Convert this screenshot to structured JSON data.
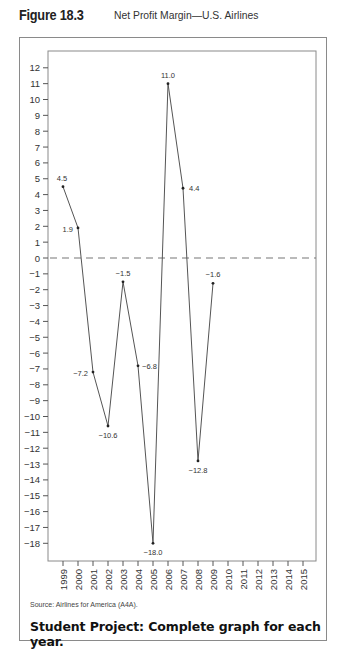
{
  "figure": {
    "number": "Figure 18.3",
    "caption": "Net Profit Margin—U.S. Airlines"
  },
  "source": "Source: Airlines for America (A4A).",
  "student_project": "Student Project: Complete graph for each year.",
  "chart_data": {
    "type": "line",
    "title": "Net Profit Margin—U.S. Airlines",
    "xlabel": "",
    "ylabel": "",
    "x": [
      1999,
      2000,
      2001,
      2002,
      2003,
      2004,
      2005,
      2006,
      2007,
      2008,
      2009
    ],
    "series": [
      {
        "name": "Net Profit Margin",
        "values": [
          4.5,
          1.9,
          -7.2,
          -10.6,
          -1.5,
          -6.8,
          -18.0,
          11.0,
          4.4,
          -12.8,
          -1.6
        ],
        "labels": [
          "4.5",
          "1.9",
          "−7.2",
          "−10.6",
          "−1.5",
          "−6.8",
          "−18.0",
          "11.0",
          "4.4",
          "−12.8",
          "−1.6"
        ]
      }
    ],
    "x_ticks": [
      "1999",
      "2000",
      "2001",
      "2002",
      "2003",
      "2004",
      "2005",
      "2006",
      "2007",
      "2008",
      "2009",
      "2010",
      "2011",
      "2012",
      "2013",
      "2014",
      "2015"
    ],
    "y_ticks": [
      12,
      11,
      10,
      9,
      8,
      7,
      6,
      5,
      4,
      3,
      2,
      1,
      0,
      -1,
      -2,
      -3,
      -4,
      -5,
      -6,
      -7,
      -8,
      -9,
      -10,
      -11,
      -12,
      -13,
      -14,
      -15,
      -16,
      -17,
      -18
    ],
    "ylim": [
      -19,
      12.5
    ],
    "xlim": [
      1998,
      2016
    ],
    "reference_line": {
      "y": 0,
      "style": "dashed"
    },
    "grid": false,
    "legend": "none"
  }
}
